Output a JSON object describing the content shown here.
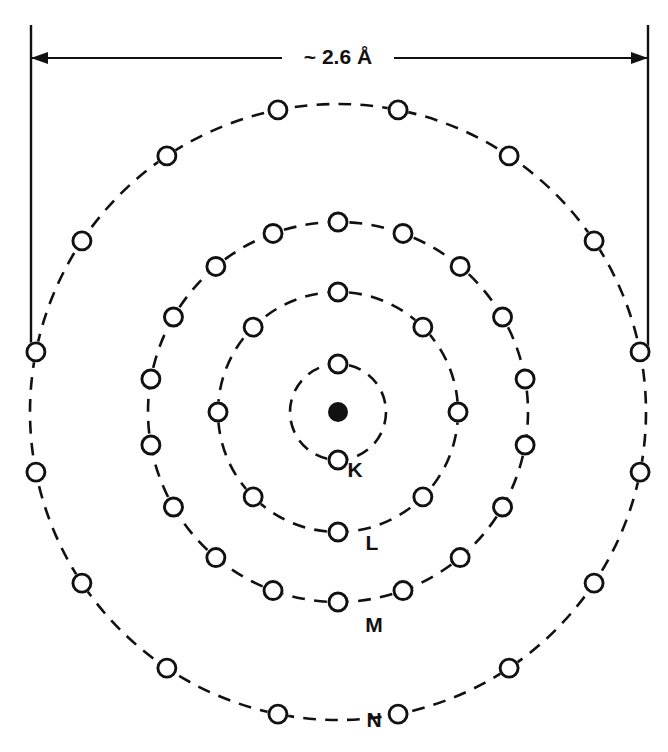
{
  "figure": {
    "type": "bohr-atom-shell-diagram",
    "background_color": "#ffffff",
    "ink_color": "#111111"
  },
  "dimension": {
    "label": "~ 2.6 Å",
    "value": 2.6,
    "unit": "Å",
    "approximate": true,
    "measures": "outer-shell-diameter",
    "left_x": 31,
    "right_x": 648,
    "arrow_y": 58,
    "extension_top_y": 25,
    "extension_bottom_y": 357,
    "label_x": 338,
    "label_y": 64
  },
  "nucleus": {
    "name": "nucleus",
    "cx": 338,
    "cy": 412,
    "r": 10,
    "fill": "#111111"
  },
  "chart_data": {
    "type": "scatter",
    "title": "",
    "xlabel": "",
    "ylabel": "",
    "center": [
      338,
      412
    ],
    "annotations": [
      "~ 2.6 Å"
    ],
    "series": [
      {
        "name": "K",
        "label": "K",
        "radius": 48,
        "electron_count": 2,
        "angle_step_deg": 180,
        "angle_offset_deg": 0,
        "electron_radius": 9,
        "label_x": 355,
        "label_y": 477
      },
      {
        "name": "L",
        "label": "L",
        "radius": 120,
        "electron_count": 8,
        "angle_step_deg": 45,
        "angle_offset_deg": 0,
        "electron_radius": 9,
        "label_x": 372,
        "label_y": 550
      },
      {
        "name": "M",
        "label": "M",
        "radius": 190,
        "electron_count": 18,
        "angle_step_deg": 20,
        "angle_offset_deg": 0,
        "electron_radius": 9,
        "label_x": 374,
        "label_y": 632
      },
      {
        "name": "N",
        "label": "N",
        "radius": 308,
        "electron_count": 16,
        "angle_step_deg": 22.5,
        "angle_offset_deg": 11.25,
        "electron_radius": 9,
        "label_x": 374,
        "label_y": 727
      }
    ]
  }
}
